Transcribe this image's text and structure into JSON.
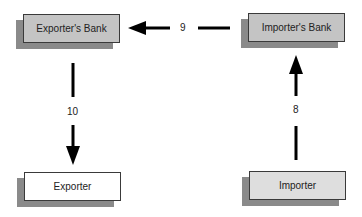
{
  "nodes": {
    "exporters_bank": {
      "label": "Exporter's Bank",
      "fill": "#c4c4c4"
    },
    "importers_bank": {
      "label": "Importer's Bank",
      "fill": "#c4c4c4"
    },
    "exporter": {
      "label": "Exporter",
      "fill": "#ffffff"
    },
    "importer": {
      "label": "Importer",
      "fill": "#dedede"
    }
  },
  "edges": [
    {
      "from": "importer",
      "to": "importers_bank",
      "label": "8"
    },
    {
      "from": "importers_bank",
      "to": "exporters_bank",
      "label": "9"
    },
    {
      "from": "exporters_bank",
      "to": "exporter",
      "label": "10"
    }
  ],
  "colors": {
    "shadow": "#8a8a8a",
    "arrow": "#000000",
    "border": "#3a3a3a"
  }
}
